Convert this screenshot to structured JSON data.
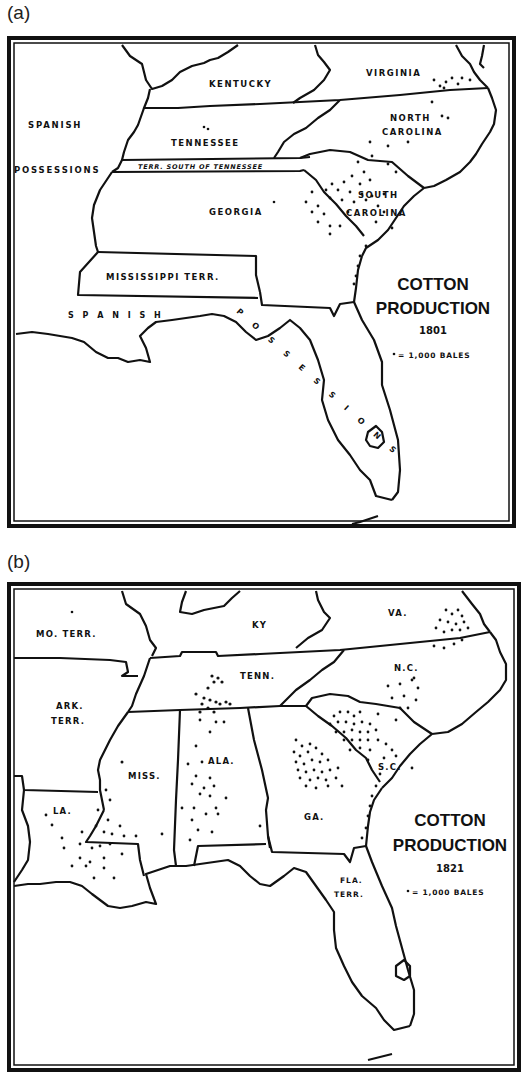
{
  "figure": {
    "panels": [
      {
        "label": "(a)",
        "title_line1": "COTTON",
        "title_line2": "PRODUCTION",
        "year": "1801",
        "legend_key": "= 1,000 BALES",
        "regions": {
          "kentucky": "KENTUCKY",
          "virginia": "VIRGINIA",
          "spanish": "SPANISH",
          "possessions": "POSSESSIONS",
          "tennessee": "TENNESSEE",
          "north_carolina_1": "NORTH",
          "north_carolina_2": "CAROLINA",
          "terr_south": "TERR. SOUTH OF TENNESSEE",
          "georgia": "GEORGIA",
          "south_carolina_1": "SOUTH",
          "south_carolina_2": "CAROLINA",
          "mississippi_terr": "MISSISSIPPI TERR.",
          "spanish_possessions_gulf": "S P A N I S H",
          "possessions_florida": "P O S S E S S I O N S"
        }
      },
      {
        "label": "(b)",
        "title_line1": "COTTON",
        "title_line2": "PRODUCTION",
        "year": "1821",
        "legend_key": "= 1,000 BALES",
        "regions": {
          "mo_terr": "MO. TERR.",
          "ky": "KY",
          "va": "VA.",
          "ark_1": "ARK.",
          "ark_2": "TERR.",
          "tenn": "TENN.",
          "nc": "N.C.",
          "miss": "MISS.",
          "ala": "ALA.",
          "sc": "S.C.",
          "la": "LA.",
          "ga": "GA.",
          "fla_1": "FLA.",
          "fla_2": "TERR."
        }
      }
    ]
  },
  "colors": {
    "ink": "#111111",
    "paper": "#ffffff"
  }
}
